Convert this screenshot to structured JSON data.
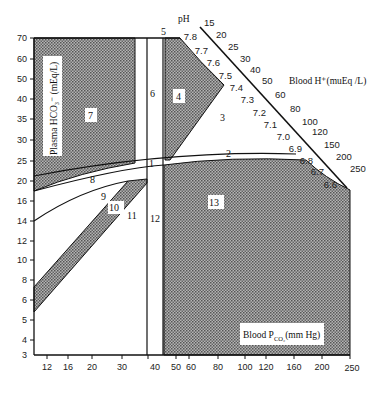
{
  "diagram": {
    "y_axis": {
      "label": "Plasma HCO₃⁻ (mEq/L)",
      "ticks": [
        "70",
        "60",
        "50",
        "40",
        "35",
        "30",
        "25",
        "20",
        "16",
        "14",
        "12",
        "10",
        "8",
        "6",
        "5",
        "4",
        "3"
      ]
    },
    "x_axis": {
      "label": "Blood P",
      "label_sub": "CO₂",
      "label_unit": "(mm Hg)",
      "ticks": [
        "12",
        "16",
        "20",
        "30",
        "40",
        "50",
        "60",
        "80",
        "100",
        "120",
        "160",
        "200",
        "250"
      ]
    },
    "ph_scale": {
      "title": "pH",
      "values": [
        "7.8",
        "7.7",
        "7.6",
        "7.5",
        "7.4",
        "7.3",
        "7.2",
        "7.1",
        "7.0",
        "6.9",
        "6.8",
        "6.7",
        "6.6"
      ]
    },
    "h_scale": {
      "title": "Blood H⁺(muEq /L)",
      "values": [
        "15",
        "20",
        "25",
        "30",
        "40",
        "50",
        "60",
        "80",
        "100",
        "120",
        "150",
        "200",
        "250"
      ]
    },
    "regions": [
      "1",
      "2",
      "3",
      "4",
      "5",
      "6",
      "7",
      "8",
      "9",
      "10",
      "11",
      "12",
      "13"
    ],
    "colors": {
      "shade": "#8c8c8c",
      "line": "#111111",
      "background": "#ffffff"
    }
  }
}
